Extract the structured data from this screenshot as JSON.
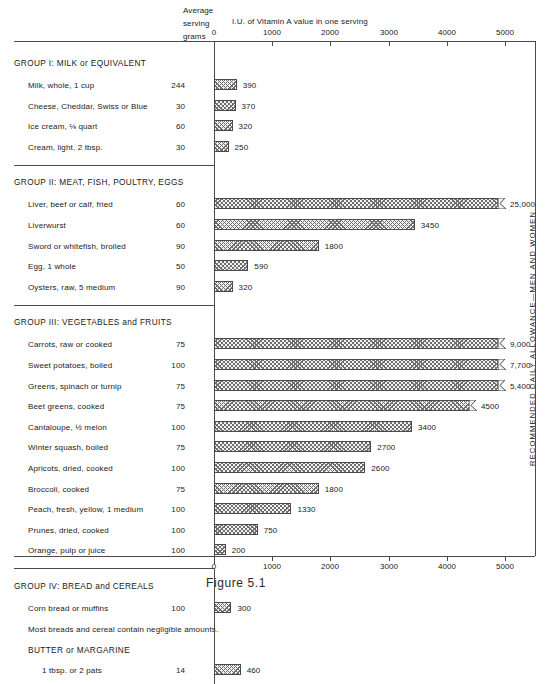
{
  "header": {
    "average_serving_line1": "Average",
    "average_serving_line2": "serving",
    "grams_label": "grams",
    "axis_title": "I.U. of Vitamin A value in one serving"
  },
  "right_caption": "RECOMMENDED DAILY ALLOWANCE—MEN AND WOMEN",
  "footer_caption": "Figure 5.1",
  "axis": {
    "ticks": [
      "0",
      "1000",
      "2000",
      "3000",
      "4000",
      "5000"
    ],
    "min": 0,
    "max": 5000
  },
  "chart_data": {
    "type": "bar",
    "orientation": "horizontal",
    "title": "I.U. of Vitamin A value in one serving",
    "xlabel": "I.U. of Vitamin A value in one serving",
    "ylabel": "",
    "xlim": [
      0,
      5000
    ],
    "grid": false,
    "legend": null,
    "columns": [
      "Food",
      "Average serving grams",
      "I.U. of Vitamin A value in one serving"
    ],
    "groups": [
      {
        "name": "GROUP I: MILK or EQUIVALENT",
        "items": [
          {
            "label": "Milk, whole, 1 cup",
            "grams": "244",
            "value": 390,
            "value_label": "390",
            "off_scale": false
          },
          {
            "label": "Cheese, Cheddar, Swiss or Blue",
            "grams": "30",
            "value": 370,
            "value_label": "370",
            "off_scale": false
          },
          {
            "label": "Ice cream, ⅛ quart",
            "grams": "60",
            "value": 320,
            "value_label": "320",
            "off_scale": false
          },
          {
            "label": "Cream, light, 2 tbsp.",
            "grams": "30",
            "value": 250,
            "value_label": "250",
            "off_scale": false
          }
        ]
      },
      {
        "name": "GROUP II: MEAT, FISH, POULTRY, EGGS",
        "items": [
          {
            "label": "Liver, beef or calf, fried",
            "grams": "60",
            "value": 25000,
            "value_label": "25,000",
            "off_scale": true
          },
          {
            "label": "Liverwurst",
            "grams": "60",
            "value": 3450,
            "value_label": "3450",
            "off_scale": false
          },
          {
            "label": "Sword or whitefish, broiled",
            "grams": "90",
            "value": 1800,
            "value_label": "1800",
            "off_scale": false
          },
          {
            "label": "Egg, 1 whole",
            "grams": "50",
            "value": 590,
            "value_label": "590",
            "off_scale": false
          },
          {
            "label": "Oysters, raw, 5 medium",
            "grams": "90",
            "value": 320,
            "value_label": "320",
            "off_scale": false
          }
        ]
      },
      {
        "name": "GROUP III: VEGETABLES and FRUITS",
        "items": [
          {
            "label": "Carrots, raw or cooked",
            "grams": "75",
            "value": 9000,
            "value_label": "9,000",
            "off_scale": true
          },
          {
            "label": "Sweet potatoes, boiled",
            "grams": "100",
            "value": 7700,
            "value_label": "7,700",
            "off_scale": true
          },
          {
            "label": "Greens, spinach or turnip",
            "grams": "75",
            "value": 5400,
            "value_label": "5,400",
            "off_scale": true
          },
          {
            "label": "Beet greens, cooked",
            "grams": "75",
            "value": 4500,
            "value_label": "4500",
            "off_scale": true
          },
          {
            "label": "Cantaloupe, ½ melon",
            "grams": "100",
            "value": 3400,
            "value_label": "3400",
            "off_scale": false
          },
          {
            "label": "Winter squash, boiled",
            "grams": "75",
            "value": 2700,
            "value_label": "2700",
            "off_scale": false
          },
          {
            "label": "Apricots, dried, cooked",
            "grams": "100",
            "value": 2600,
            "value_label": "2600",
            "off_scale": false
          },
          {
            "label": "Broccoli, cooked",
            "grams": "75",
            "value": 1800,
            "value_label": "1800",
            "off_scale": false
          },
          {
            "label": "Peach, fresh, yellow, 1 medium",
            "grams": "100",
            "value": 1330,
            "value_label": "1330",
            "off_scale": false
          },
          {
            "label": "Prunes, dried, cooked",
            "grams": "100",
            "value": 750,
            "value_label": "750",
            "off_scale": false
          },
          {
            "label": "Orange, pulp or juice",
            "grams": "100",
            "value": 200,
            "value_label": "200",
            "off_scale": false
          }
        ]
      },
      {
        "name": "GROUP IV: BREAD and CEREALS",
        "items": [
          {
            "label": "Corn bread or muffins",
            "grams": "100",
            "value": 300,
            "value_label": "300",
            "off_scale": false
          }
        ],
        "note": "Most breads and cereal contain negligible amounts.",
        "subheading": "BUTTER or MARGARINE",
        "sub_items": [
          {
            "label": "1 tbsp. or 2 pats",
            "grams": "14",
            "value": 460,
            "value_label": "460",
            "off_scale": false
          }
        ]
      }
    ]
  },
  "colors": {
    "ink": "#1a1a1a",
    "rule": "#4a4a4a",
    "hatch": "#6e6e6e",
    "bar_fill": "#f2f2f2"
  }
}
